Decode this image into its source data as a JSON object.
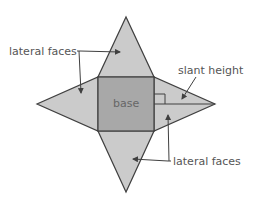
{
  "diagram": {
    "labels": {
      "lateral_faces_top": "lateral faces",
      "slant_height": "slant height",
      "base": "base",
      "lateral_faces_bottom": "lateral faces"
    },
    "colors": {
      "lateral_face_fill": "#cbcbcb",
      "base_fill": "#a8a8a8",
      "outline": "#404040",
      "text": "#555555"
    }
  }
}
